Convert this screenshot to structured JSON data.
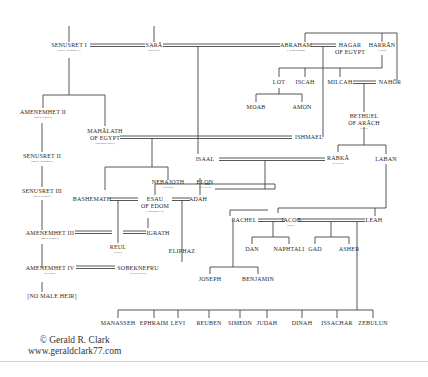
{
  "people": {
    "senusret1": {
      "name": "SENUSRET I",
      "sub": "(son of Amenemhet I)"
    },
    "sara": {
      "name": "SARĀ",
      "sub": "(half sister)"
    },
    "abraham": {
      "name": "ABRAHAM",
      "sub": "(Abram/Ibrahim)"
    },
    "hagar": {
      "name": "HAGAR",
      "name2": "OF EGYPT"
    },
    "harran": {
      "name": "HARRĀN",
      "sub": "(Haran)"
    },
    "lot": {
      "name": "LOT"
    },
    "iscah": {
      "name": "ISCAH"
    },
    "milcah": {
      "name": "MILCAH"
    },
    "nahor": {
      "name": "NAHŌR"
    },
    "moab": {
      "name": "MOAB"
    },
    "amon": {
      "name": "AMON"
    },
    "bethuel": {
      "name": "BETHUEL",
      "name2": "OF ARĀCH",
      "sub": "(Uruk)"
    },
    "amenemhet2": {
      "name": "AMENEMHET II",
      "sub": "(son of Senusret)"
    },
    "senusret2": {
      "name": "SENUSRET II",
      "sub": "(son of Amenemhet)"
    },
    "senusret3": {
      "name": "SENUSRET III",
      "sub": "(son of Senusret)"
    },
    "amenemhet3": {
      "name": "AMENEMHET III",
      "sub": "(son of Senusret)"
    },
    "amenemhet4": {
      "name": "AMENEMHET IV",
      "sub": "(co-regent)"
    },
    "nomaleheir": {
      "name": "[NO MALE HEIR]"
    },
    "mahalath": {
      "name": "MAHĀLATH",
      "name2": "OF EGYPT",
      "sub": "(Basemath/Nofret)"
    },
    "ishmael": {
      "name": "ISHMAEL"
    },
    "isaac": {
      "name": "ISAAL"
    },
    "rabka": {
      "name": "RABKĀ",
      "sub": "(Rebecca)"
    },
    "laban": {
      "name": "LABAN"
    },
    "nebajoth": {
      "name": "NEBAJOTH",
      "sub": "(Nebaioth)"
    },
    "elon": {
      "name": "ELON",
      "sub": "(the Hittite)"
    },
    "bashemath": {
      "name": "BASHEMATH"
    },
    "esau": {
      "name": "ESAU",
      "name2": "OF EDOM",
      "sub": "(Amenemhet III)"
    },
    "adah": {
      "name": "ADAH"
    },
    "reul": {
      "name": "REUL",
      "sub": "(Reuel)"
    },
    "igrath": {
      "name": "IGRATH"
    },
    "eliphaz": {
      "name": "ELIPHAZ"
    },
    "sobeknefru": {
      "name": "SOBEKNEFRU",
      "sub": "(last of dynasty)"
    },
    "rachel": {
      "name": "RACHEL"
    },
    "jacob": {
      "name": "JACOB",
      "sub": "(Israel)"
    },
    "leah": {
      "name": "LEAH"
    },
    "dan": {
      "name": "DAN"
    },
    "naphtali": {
      "name": "NAPHTALI"
    },
    "gad": {
      "name": "GAD"
    },
    "asher": {
      "name": "ASHER"
    },
    "joseph": {
      "name": "JOSEPH"
    },
    "benjamin": {
      "name": "BENJAMIN"
    }
  },
  "sons_of_leah_row": [
    "MANASSEH",
    "EPHRAIM",
    "LEVI",
    "REUBEN",
    "SIMEON",
    "JUDAH",
    "DINAH",
    "ISSACHAR",
    "ZEBULUN"
  ],
  "credit": {
    "line1": "© Gerald R. Clark",
    "line2": "www.geraldclark77.com"
  }
}
